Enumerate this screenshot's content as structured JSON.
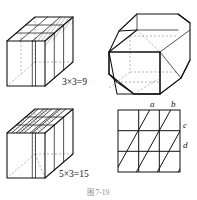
{
  "figure": {
    "caption": "图 7-19",
    "panels": [
      {
        "id": "panel-top-left",
        "name": "cube-three-by-three-slices",
        "equation": "3×3=9",
        "description": "cube with 3 by 3 grid on top face, rightmost column hatched",
        "grid_rows": 3,
        "grid_cols": 3
      },
      {
        "id": "panel-top-right",
        "name": "cube-truncated-corners",
        "equation": "",
        "description": "cube with corners truncated forming a hexagonal cross-section"
      },
      {
        "id": "panel-bottom-left",
        "name": "cube-diagonal-slices",
        "equation": "5×3=15",
        "description": "cube with diagonal hatched bands across top face",
        "grid_rows": 3,
        "grid_cols": 3
      },
      {
        "id": "panel-bottom-right",
        "name": "square-grid-with-diagonals",
        "equation": "",
        "description": "3 by 3 square grid crossed by four parallel diagonal lines",
        "grid_rows": 3,
        "grid_cols": 3,
        "diagonal_labels": [
          "a",
          "b",
          "c",
          "d"
        ]
      }
    ],
    "labels": {
      "a": "a",
      "b": "b",
      "c": "c",
      "d": "d"
    },
    "colors": {
      "ink": "#111111",
      "hidden": "#9a9a9a",
      "hatch": "#2a2a2a",
      "background": "#ffffff",
      "caption": "#8d8d8d"
    }
  }
}
